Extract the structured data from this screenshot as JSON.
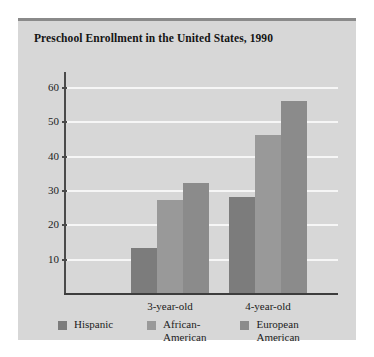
{
  "chart_data": {
    "type": "bar",
    "title": "Preschool Enrollment in the United States, 1990",
    "xlabel": "",
    "ylabel": "",
    "categories": [
      "3-year-old",
      "4-year-old"
    ],
    "series": [
      {
        "name": "Hispanic",
        "values": [
          13,
          28
        ],
        "color": "#7c7c7c"
      },
      {
        "name": "African-\nAmerican",
        "values": [
          27,
          46
        ],
        "color": "#999999"
      },
      {
        "name": "European\nAmerican",
        "values": [
          32,
          56
        ],
        "color": "#8b8b8b"
      }
    ],
    "yticks": [
      10,
      20,
      30,
      40,
      50,
      60
    ],
    "ylim": [
      0,
      65
    ],
    "grid": true,
    "legend_position": "bottom",
    "gridline_color": "#f6f6f6",
    "axis_color": "#3d3d3d",
    "background_color": "#d7d7d7"
  },
  "legend": {
    "items": [
      {
        "label": "Hispanic",
        "color": "#7c7c7c"
      },
      {
        "label": "African-\nAmerican",
        "color": "#999999"
      },
      {
        "label": "European\nAmerican",
        "color": "#8b8b8b"
      }
    ]
  }
}
